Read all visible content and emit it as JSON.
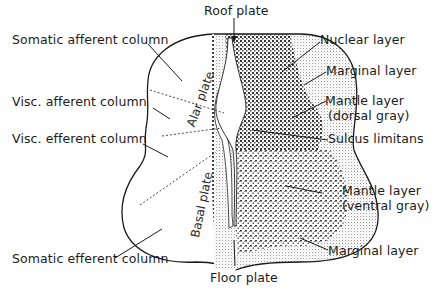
{
  "figure": {
    "colors": {
      "ink": "#1a1a1a",
      "stipple_dark": "#2b2b2b",
      "stipple_light": "#9a9a9a",
      "background": "#ffffff"
    }
  },
  "labels": {
    "top": {
      "roof_plate": "Roof plate"
    },
    "bottom": {
      "floor_plate": "Floor plate"
    },
    "left": {
      "somatic_afferent": "Somatic afferent column",
      "visc_afferent": "Visc. afferent column",
      "visc_efferent": "Visc. efferent column",
      "somatic_efferent": "Somatic efferent column"
    },
    "right": {
      "nuclear_layer": "Nuclear layer",
      "marginal_layer_top": "Marginal layer",
      "mantle_dorsal_1": "Mantle layer",
      "mantle_dorsal_2": "(dorsal gray)",
      "sulcus_limitans": "Sulcus limitans",
      "mantle_ventral_1": "Mantle layer",
      "mantle_ventral_2": "(ventral gray)",
      "marginal_layer_bottom": "Marginal layer"
    },
    "plates": {
      "alar": "Alar plate",
      "basal": "Basal plate"
    }
  }
}
